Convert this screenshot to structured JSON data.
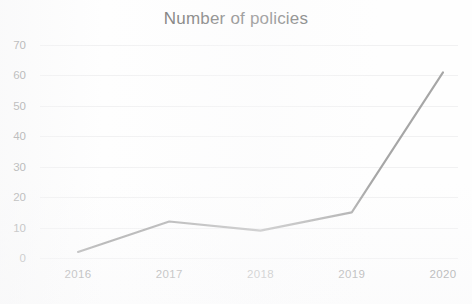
{
  "chart_data": {
    "type": "line",
    "title": "Number of policies",
    "xlabel": "",
    "ylabel": "",
    "categories": [
      "2016",
      "2017",
      "2018",
      "2019",
      "2020"
    ],
    "x": [
      2016,
      2017,
      2018,
      2019,
      2020
    ],
    "values": [
      2,
      12,
      9,
      15,
      61
    ],
    "series": [
      {
        "name": "Number of policies",
        "values": [
          2,
          12,
          9,
          15,
          61
        ]
      }
    ],
    "ylim": [
      0,
      70
    ],
    "yticks": [
      0,
      10,
      20,
      30,
      40,
      50,
      60,
      70
    ],
    "ytick_labels": [
      "0",
      "10",
      "20",
      "30",
      "40",
      "50",
      "60",
      "70"
    ],
    "xtick_labels": [
      "2016",
      "2017",
      "2018",
      "2019",
      "2020"
    ],
    "grid": true,
    "legend": false,
    "legend_position": "none",
    "line_color": "#9a9a9a",
    "title_color": "#70706f",
    "tick_color": "#8e8e8e",
    "background_color": "#fefefe"
  }
}
